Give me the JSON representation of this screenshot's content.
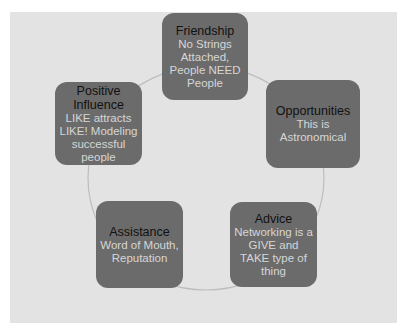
{
  "diagram": {
    "type": "cycle",
    "colors": {
      "background": "#e3e3e3",
      "node_fill": "#6b6b6b",
      "title_text": "#111111",
      "desc_text": "#d6d6d6",
      "ring": "#bdbdbd"
    },
    "nodes": [
      {
        "title": "Friendship",
        "description": "No Strings Attached, People NEED People"
      },
      {
        "title": "Opportunities",
        "description": "This is Astronomical"
      },
      {
        "title": "Advice",
        "description": "Networking is a GIVE and TAKE type of thing"
      },
      {
        "title": "Assistance",
        "description": "Word of Mouth, Reputation"
      },
      {
        "title": "Positive Influence",
        "description": "LIKE attracts LIKE! Modeling successful people"
      }
    ]
  }
}
